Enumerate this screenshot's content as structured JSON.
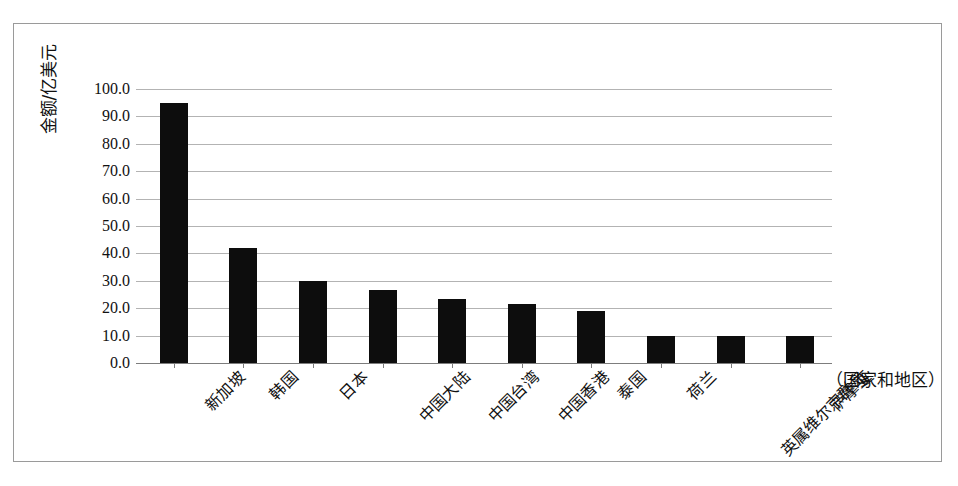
{
  "chart_data": {
    "type": "bar",
    "title": "",
    "subtitle": "",
    "xlabel": "（国家和地区）",
    "ylabel": "金额/亿美元",
    "categories": [
      "新加坡",
      "韩国",
      "日本",
      "中国大陆",
      "中国台湾",
      "中国香港",
      "泰国",
      "荷兰",
      "英属维尔京群岛",
      "萨摩亚"
    ],
    "values": [
      95.0,
      42.0,
      30.0,
      26.5,
      23.5,
      21.5,
      19.0,
      10.0,
      10.0,
      10.0
    ],
    "series": [
      {
        "name": "金额",
        "values": [
          95.0,
          42.0,
          30.0,
          26.5,
          23.5,
          21.5,
          19.0,
          10.0,
          10.0,
          10.0
        ]
      }
    ],
    "ylim": [
      0,
      100
    ],
    "ytick_labels": [
      "100.0",
      "90.0",
      "80.0",
      "70.0",
      "60.0",
      "50.0",
      "40.0",
      "30.0",
      "20.0",
      "10.0",
      "0.0"
    ],
    "ytick_values": [
      100,
      90,
      80,
      70,
      60,
      50,
      40,
      30,
      20,
      10,
      0
    ],
    "grid": true,
    "legend": false,
    "legend_position": "none",
    "bar_color": "#0d0d0d",
    "gridline_color": "#b3b3b3",
    "axis_color": "#7d7d7d",
    "frame_color": "#9a9a9a",
    "background_color": "#ffffff"
  }
}
